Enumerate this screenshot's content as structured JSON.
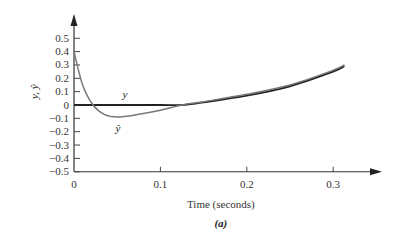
{
  "chart_data": {
    "type": "line",
    "title": "",
    "caption": "(a)",
    "xlabel": "Time (seconds)",
    "ylabel": "y, ŷ",
    "xlim": [
      0,
      0.35
    ],
    "ylim": [
      -0.5,
      0.55
    ],
    "grid": false,
    "legend": "inline labels",
    "x_ticks": [
      "0",
      "0.1",
      "0.2",
      "0.3"
    ],
    "y_ticks": [
      "0.5",
      "0.4",
      "0.3",
      "0.2",
      "0.1",
      "0",
      "-0.1",
      "-0.2",
      "-0.3",
      "-0.4",
      "-0.5"
    ],
    "series": [
      {
        "name": "y",
        "label": "y",
        "color": "#222222",
        "x": [
          0,
          0.05,
          0.1,
          0.125,
          0.15,
          0.2,
          0.25,
          0.3,
          0.313
        ],
        "values": [
          0,
          0,
          0,
          0,
          0.02,
          0.07,
          0.14,
          0.25,
          0.29
        ]
      },
      {
        "name": "y_hat",
        "label": "ŷ",
        "color": "#777777",
        "x": [
          0,
          0.01,
          0.022,
          0.035,
          0.05,
          0.075,
          0.1,
          0.125,
          0.15,
          0.2,
          0.25,
          0.3,
          0.313
        ],
        "values": [
          0.4,
          0.15,
          0.0,
          -0.07,
          -0.09,
          -0.07,
          -0.04,
          0.0,
          0.025,
          0.08,
          0.15,
          0.26,
          0.3
        ]
      }
    ]
  }
}
